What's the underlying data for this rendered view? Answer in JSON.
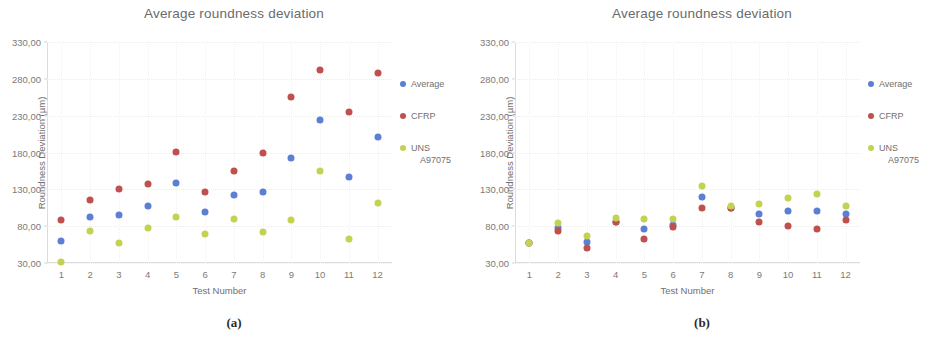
{
  "colors": {
    "average": "#5b7fd4",
    "cfrp": "#c0504d",
    "uns": "#c3d250",
    "axis": "#dcdcdc",
    "text": "#6f6f6f"
  },
  "panels": [
    {
      "caption": "(a)",
      "title": "Average roundness deviation",
      "xlabel": "Test Number",
      "ylabel": "Roundness Deviation (µm)",
      "yticks": [
        "330,00",
        "280,00",
        "230,00",
        "180,00",
        "130,00",
        "80,00",
        "30,00"
      ],
      "xticks": [
        "1",
        "2",
        "3",
        "4",
        "5",
        "6",
        "7",
        "8",
        "9",
        "10",
        "11",
        "12"
      ],
      "legend": [
        {
          "label": "Average",
          "sub": "",
          "color": "#5b7fd4"
        },
        {
          "label": "CFRP",
          "sub": "",
          "color": "#c0504d"
        },
        {
          "label": "UNS",
          "sub": "A97075",
          "color": "#c3d250"
        }
      ]
    },
    {
      "caption": "(b)",
      "title": "Average roundness deviation",
      "xlabel": "Test Number",
      "ylabel": "Roundness Deviation (µm)",
      "yticks": [
        "330,00",
        "280,00",
        "230,00",
        "180,00",
        "130,00",
        "80,00",
        "30,00"
      ],
      "xticks": [
        "1",
        "2",
        "3",
        "4",
        "5",
        "6",
        "7",
        "8",
        "9",
        "10",
        "11",
        "12"
      ],
      "legend": [
        {
          "label": "Average",
          "sub": "",
          "color": "#5b7fd4"
        },
        {
          "label": "CFRP",
          "sub": "",
          "color": "#c0504d"
        },
        {
          "label": "UNS",
          "sub": "A97075",
          "color": "#c3d250"
        }
      ]
    }
  ],
  "chart_data": [
    {
      "type": "scatter",
      "panel": "(a)",
      "title": "Average roundness deviation",
      "xlabel": "Test Number",
      "ylabel": "Roundness Deviation (µm)",
      "x": [
        1,
        2,
        3,
        4,
        5,
        6,
        7,
        8,
        9,
        10,
        11,
        12
      ],
      "xlim": [
        0.5,
        12.5
      ],
      "ylim": [
        30,
        330
      ],
      "yticks": [
        30,
        80,
        130,
        180,
        230,
        280,
        330
      ],
      "grid": true,
      "legend_position": "right",
      "series": [
        {
          "name": "Average",
          "color": "#5b7fd4",
          "values": [
            60,
            93,
            95,
            108,
            138,
            99,
            122,
            127,
            172,
            224,
            147,
            201
          ]
        },
        {
          "name": "CFRP",
          "color": "#c0504d",
          "values": [
            88,
            116,
            131,
            137,
            181,
            126,
            155,
            180,
            255,
            292,
            235,
            288
          ]
        },
        {
          "name": "UNS A97075",
          "color": "#c3d250",
          "values": [
            32,
            73,
            57,
            77,
            92,
            70,
            90,
            72,
            89,
            155,
            63,
            112
          ]
        }
      ]
    },
    {
      "type": "scatter",
      "panel": "(b)",
      "title": "Average roundness deviation",
      "xlabel": "Test Number",
      "ylabel": "Roundness Deviation (µm)",
      "x": [
        1,
        2,
        3,
        4,
        5,
        6,
        7,
        8,
        9,
        10,
        11,
        12
      ],
      "xlim": [
        0.5,
        12.5
      ],
      "ylim": [
        30,
        330
      ],
      "yticks": [
        30,
        80,
        130,
        180,
        230,
        280,
        330
      ],
      "grid": true,
      "legend_position": "right",
      "series": [
        {
          "name": "Average",
          "color": "#5b7fd4",
          "values": [
            57,
            78,
            58,
            86,
            76,
            81,
            120,
            105,
            96,
            100,
            100,
            97
          ]
        },
        {
          "name": "CFRP",
          "color": "#c0504d",
          "values": [
            57,
            74,
            50,
            85,
            63,
            79,
            105,
            105,
            86,
            80,
            76,
            89
          ]
        },
        {
          "name": "UNS A97075",
          "color": "#c3d250",
          "values": [
            57,
            84,
            67,
            91,
            90,
            90,
            135,
            107,
            110,
            118,
            124,
            108
          ]
        }
      ]
    }
  ]
}
